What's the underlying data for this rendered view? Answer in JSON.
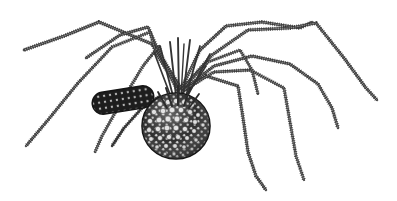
{
  "image": {
    "kind": "line-engraving-illustration",
    "subject_common_name": "harvestman",
    "alt_common_name": "daddy long-legs",
    "background_color": "#ffffff",
    "ink_color": "#3b3b3b",
    "body_dark_color": "#262626",
    "tubercle_highlight_color": "#e8e8e8",
    "width_px": 397,
    "height_px": 201,
    "palette_note": "monochrome",
    "visible_text": "",
    "caption": ""
  },
  "anatomy": {
    "abdomen": {
      "name": "abdomen",
      "center_x": 176,
      "center_y": 126,
      "radius_x": 34,
      "radius_y": 33,
      "texture": "granulated-tubercles"
    },
    "prosoma": {
      "name": "cephalothorax-capsule",
      "center_x": 123,
      "center_y": 100,
      "length": 62,
      "height": 22,
      "rotation_deg": -9,
      "texture": "banded-with-light-spots"
    },
    "leg_convergence": {
      "x": 181,
      "y": 88
    },
    "leg_count": 8
  },
  "legs": [
    {
      "id": "leg-left-1",
      "label": "left leg 1 (front, far reach)",
      "path": "M 181 88 L 152 44 L 99 22 L 64 36 L 24 50",
      "core_width": 2.2,
      "tip_x": 24,
      "tip_y": 50
    },
    {
      "id": "leg-left-2",
      "label": "left leg 2",
      "path": "M 180 89 L 158 50 L 148 27 L 120 35 L 86 58",
      "core_width": 2.0,
      "tip_x": 86,
      "tip_y": 58
    },
    {
      "id": "leg-left-3",
      "label": "left leg 3 (descending)",
      "path": "M 179 90 L 156 53 L 150 32 L 112 47 L 78 83 L 48 120 L 26 146",
      "core_width": 2.0,
      "tip_x": 26,
      "tip_y": 146
    },
    {
      "id": "leg-left-4",
      "label": "left leg 4 (short, under body)",
      "path": "M 178 92 L 163 60 L 159 46 L 143 66 L 120 104 L 102 136 L 95 152",
      "core_width": 1.9,
      "tip_x": 95,
      "tip_y": 152
    },
    {
      "id": "leg-right-1",
      "label": "right leg 1 (front, arching)",
      "path": "M 182 87 L 200 50 L 226 26 L 262 22 L 300 28 L 312 22",
      "core_width": 2.1,
      "tip_x": 312,
      "tip_y": 22
    },
    {
      "id": "leg-right-2",
      "label": "right leg 2 (longest, far right)",
      "path": "M 183 88 L 212 55 L 248 30 L 290 28 L 316 23 L 344 58 L 366 88 L 377 100",
      "core_width": 2.1,
      "tip_x": 377,
      "tip_y": 100
    },
    {
      "id": "leg-right-3",
      "label": "right leg 3 (mid, descends right)",
      "path": "M 183 90 L 214 66 L 252 56 L 290 64 L 318 84 L 332 108 L 338 128",
      "core_width": 2.0,
      "tip_x": 338,
      "tip_y": 128
    },
    {
      "id": "leg-right-4",
      "label": "right leg 4 (rear, drops steeply)",
      "path": "M 182 92 L 206 76 L 238 86 L 243 118 L 248 152 L 256 176 L 266 190",
      "core_width": 2.0,
      "tip_x": 266,
      "tip_y": 190
    },
    {
      "id": "leg-right-5",
      "label": "right leg 5 (rear inner, drops steeply)",
      "path": "M 184 90 L 214 72 L 250 70 L 284 88 L 290 122 L 296 156 L 304 180",
      "core_width": 1.9,
      "tip_x": 304,
      "tip_y": 180
    },
    {
      "id": "leg-right-6",
      "label": "right leg 6 (inner short bend)",
      "path": "M 182 89 L 208 62 L 240 50 L 252 70 L 258 94",
      "core_width": 1.8,
      "tip_x": 258,
      "tip_y": 94
    }
  ],
  "pedipalp": {
    "id": "pedipalp-left",
    "label": "left pedipalp / front appendage",
    "path": "M 160 96 L 142 108 L 124 128 L 112 146",
    "core_width": 2.0
  },
  "tubercles": {
    "count_rows": 7,
    "highlight_color": "#e8e8e8",
    "dark_color": "#1f1f1f"
  }
}
